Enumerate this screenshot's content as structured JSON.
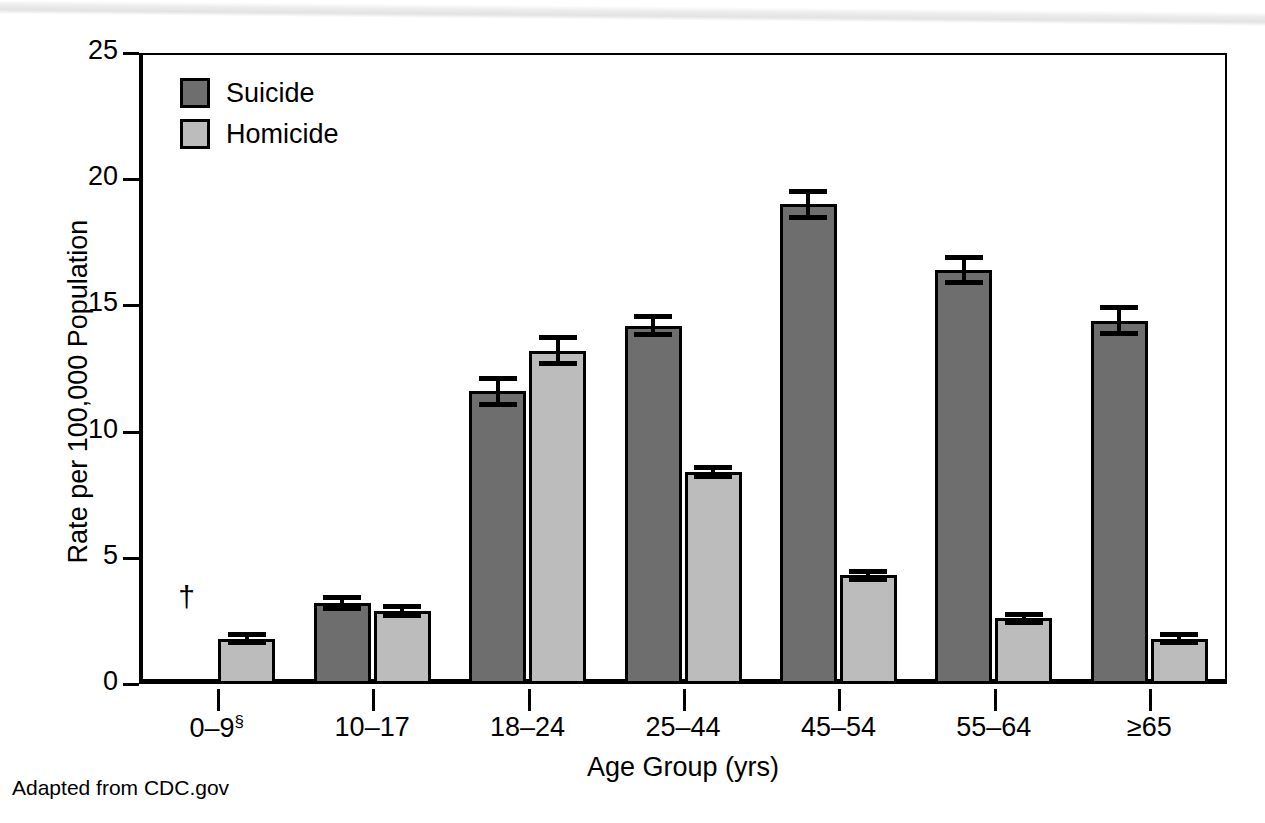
{
  "caption": "Adapted from CDC.gov",
  "legend": {
    "position": "top-left",
    "items": [
      {
        "label": "Suicide",
        "color": "#6e6e6e",
        "icon": "square-swatch-icon"
      },
      {
        "label": "Homicide",
        "color": "#bcbcbc",
        "icon": "square-swatch-icon"
      }
    ]
  },
  "annotations": {
    "dagger": "†",
    "section_mark": "§"
  },
  "chart_data": {
    "type": "bar",
    "title": "",
    "subtitle": "",
    "xlabel": "Age Group (yrs)",
    "ylabel": "Rate per 100,000 Population",
    "ylim": [
      0,
      25
    ],
    "yticks": [
      0,
      5,
      10,
      15,
      20,
      25
    ],
    "ytick_labels": [
      "0",
      "5",
      "10",
      "15",
      "20",
      "25"
    ],
    "grid": false,
    "legend_position": "top-left",
    "categories": [
      "0–9§",
      "10–17",
      "18–24",
      "25–44",
      "45–54",
      "55–64",
      "≥65"
    ],
    "series": [
      {
        "name": "Suicide",
        "color": "#6e6e6e",
        "values": [
          null,
          3.2,
          11.6,
          14.2,
          19.0,
          16.4,
          14.4
        ],
        "errors": [
          null,
          0.15,
          0.45,
          0.3,
          0.45,
          0.45,
          0.45
        ],
        "notes": [
          "Rate not shown; marked with dagger (†)",
          "",
          "",
          "",
          "",
          "",
          ""
        ]
      },
      {
        "name": "Homicide",
        "color": "#bcbcbc",
        "values": [
          1.8,
          2.9,
          13.2,
          8.4,
          4.3,
          2.6,
          1.8
        ],
        "errors": [
          0.1,
          0.12,
          0.45,
          0.12,
          0.1,
          0.1,
          0.1
        ],
        "notes": [
          "",
          "",
          "",
          "",
          "",
          "",
          ""
        ]
      }
    ]
  }
}
